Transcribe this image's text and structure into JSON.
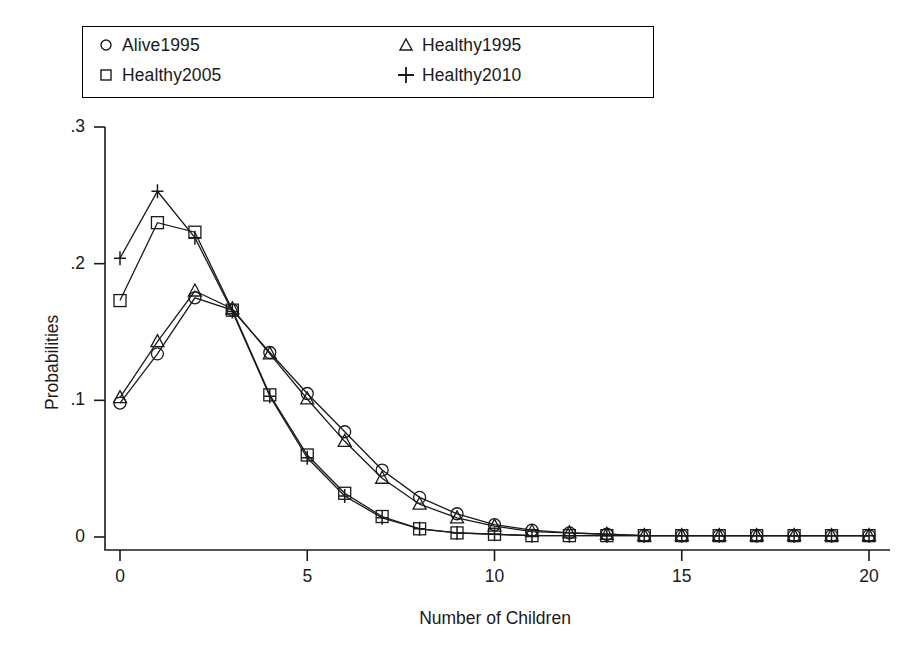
{
  "chart_data": {
    "type": "line",
    "title": "",
    "xlabel": "Number of Children",
    "ylabel": "Probabilities",
    "xlim": [
      -0.6,
      20.6
    ],
    "ylim": [
      0,
      0.31
    ],
    "xticks": [
      0,
      5,
      10,
      15,
      20
    ],
    "xtick_labels": [
      "0",
      "5",
      "10",
      "15",
      "20"
    ],
    "yticks": [
      0,
      0.1,
      0.2,
      0.3
    ],
    "ytick_labels": [
      "0",
      ".1",
      ".2",
      ".3"
    ],
    "grid": false,
    "legend_position": "top-left-outside",
    "x": [
      0,
      1,
      2,
      3,
      4,
      5,
      6,
      7,
      8,
      9,
      10,
      11,
      12,
      13,
      14,
      15,
      16,
      17,
      18,
      19,
      20
    ],
    "series": [
      {
        "name": "Alive1995",
        "marker": "circle",
        "values": [
          0.098,
          0.134,
          0.175,
          0.166,
          0.135,
          0.105,
          0.077,
          0.049,
          0.029,
          0.017,
          0.009,
          0.005,
          0.003,
          0.002,
          0.001,
          0.001,
          0.001,
          0.001,
          0.001,
          0.001,
          0.001
        ]
      },
      {
        "name": "Healthy2005",
        "marker": "square",
        "values": [
          0.173,
          0.23,
          0.223,
          0.166,
          0.104,
          0.06,
          0.032,
          0.015,
          0.006,
          0.003,
          0.002,
          0.001,
          0.001,
          0.001,
          0.001,
          0.001,
          0.001,
          0.001,
          0.001,
          0.001,
          0.001
        ]
      },
      {
        "name": "Healthy1995",
        "marker": "triangle",
        "values": [
          0.102,
          0.143,
          0.18,
          0.167,
          0.134,
          0.101,
          0.07,
          0.043,
          0.024,
          0.014,
          0.008,
          0.004,
          0.003,
          0.002,
          0.001,
          0.001,
          0.001,
          0.001,
          0.001,
          0.001,
          0.001
        ]
      },
      {
        "name": "Healthy2010",
        "marker": "plus",
        "values": [
          0.204,
          0.253,
          0.219,
          0.165,
          0.103,
          0.058,
          0.03,
          0.014,
          0.006,
          0.003,
          0.002,
          0.001,
          0.001,
          0.001,
          0.001,
          0.001,
          0.001,
          0.001,
          0.001,
          0.001,
          0.001
        ]
      }
    ]
  },
  "legend": {
    "entries": [
      {
        "label": "Alive1995",
        "marker": "circle-icon"
      },
      {
        "label": "Healthy2005",
        "marker": "square-icon"
      },
      {
        "label": "Healthy1995",
        "marker": "triangle-icon"
      },
      {
        "label": "Healthy2010",
        "marker": "plus-icon"
      }
    ]
  },
  "colors": {
    "ink": "#1a1a1a",
    "background": "#ffffff"
  }
}
